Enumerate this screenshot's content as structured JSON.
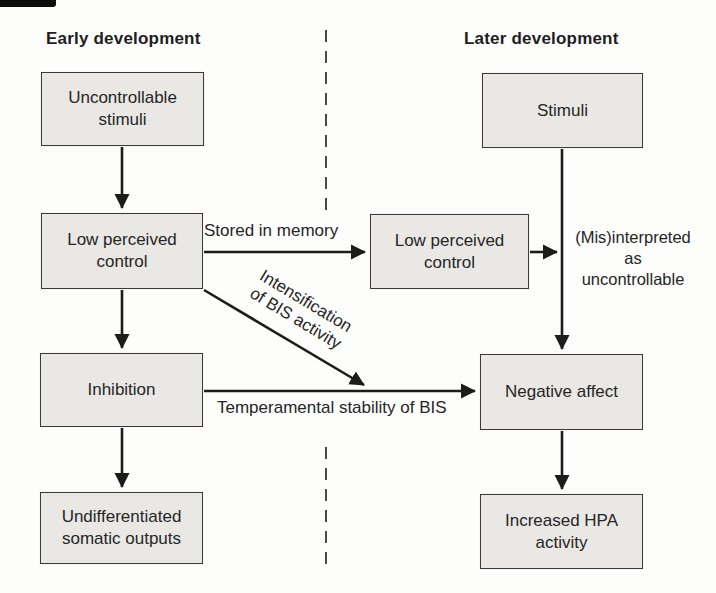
{
  "diagram": {
    "headers": {
      "early": "Early development",
      "later": "Later development"
    },
    "boxes": {
      "uncontrollable_stimuli": "Uncontrollable\nstimuli",
      "low_perceived_control_early": "Low perceived\ncontrol",
      "inhibition": "Inhibition",
      "undifferentiated_somatic_outputs": "Undifferentiated\nsomatic outputs",
      "stimuli": "Stimuli",
      "low_perceived_control_later": "Low perceived\ncontrol",
      "negative_affect": "Negative affect",
      "increased_hpa_activity": "Increased HPA\nactivity"
    },
    "edge_labels": {
      "stored_in_memory": "Stored in memory",
      "intensification_of_bis": "Intensification\nof BIS activity",
      "temperamental_stability": "Temperamental stability of BIS",
      "misinterpreted": "(Mis)interpreted\nas\nuncontrollable"
    },
    "colors": {
      "box_fill": "#e9e8e5",
      "box_border": "#3a3a3a",
      "arrow": "#1c1c1c",
      "text": "#262626",
      "divider": "#4a4a4a",
      "background": "#fdfdfc"
    }
  }
}
